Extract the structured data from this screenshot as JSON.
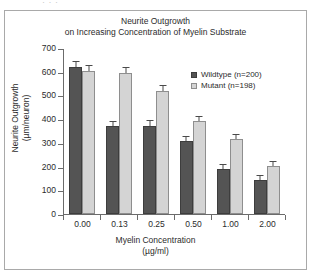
{
  "top_remnant_text": "· · ·",
  "chart_data": {
    "type": "bar",
    "title": "Neurite Outgrowth on Increasing Concentration of Myelin Substrate",
    "title_lines": [
      "Neurite Outgrowth",
      "on Increasing Concentration of Myelin Substrate"
    ],
    "xlabel": "Myelin Concentration (µg/ml)",
    "xlabel_lines": [
      "Myelin Concentration",
      "(µg/ml)"
    ],
    "ylabel": "Neurite Outgrowth (µm/neuron)",
    "ylabel_lines": [
      "Neurite Outgrowth",
      "(µm/neuron)"
    ],
    "categories": [
      "0.00",
      "0.13",
      "0.25",
      "0.50",
      "1.00",
      "2.00"
    ],
    "ylim": [
      0,
      700
    ],
    "yticks": [
      0,
      100,
      200,
      300,
      400,
      500,
      600,
      700
    ],
    "ytick_labels": [
      "0",
      "100",
      "200",
      "300",
      "400",
      "500",
      "600",
      "700"
    ],
    "grid": false,
    "legend_position": "upper-right-inside",
    "series": [
      {
        "name": "Wildtype (n=200)",
        "color": "#545454",
        "values": [
          620,
          370,
          372,
          308,
          188,
          142
        ],
        "errors": [
          22,
          20,
          20,
          16,
          18,
          17
        ]
      },
      {
        "name": "Mutant (n=198)",
        "color": "#d4d4d4",
        "values": [
          605,
          595,
          517,
          392,
          318,
          203
        ],
        "errors": [
          18,
          22,
          22,
          16,
          14,
          15
        ]
      }
    ]
  }
}
